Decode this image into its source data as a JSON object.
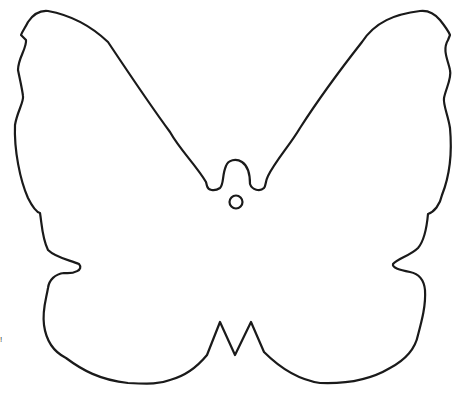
{
  "figure": {
    "stroke_color": "#1a1a1a",
    "fill_color": "#ffffff",
    "background": "#ffffff",
    "elements": [
      "butterfly-outline",
      "hanging-hole"
    ],
    "edge_mark": "!"
  }
}
